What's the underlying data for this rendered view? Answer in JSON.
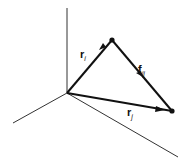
{
  "diagram": {
    "title": "",
    "colors": {
      "axis": "#333333",
      "vector": "#111111",
      "background": "#ffffff"
    },
    "axes": {
      "origin": [
        67,
        93
      ],
      "up": [
        67,
        8
      ],
      "left": [
        13,
        123
      ],
      "right": [
        178,
        157
      ]
    },
    "points": {
      "i": [
        112,
        40
      ],
      "j": [
        172,
        111
      ]
    },
    "labels": {
      "r_i": {
        "main": "r",
        "sub": "i"
      },
      "f_ij": {
        "main": "f",
        "sub": "ij"
      },
      "r_j": {
        "main": "r",
        "sub": "j"
      }
    },
    "vectors": [
      {
        "name": "r_i",
        "from": "origin",
        "to": "i"
      },
      {
        "name": "f_ij",
        "from": "i",
        "to": "j"
      },
      {
        "name": "r_j",
        "from": "origin",
        "to": "j"
      }
    ]
  }
}
